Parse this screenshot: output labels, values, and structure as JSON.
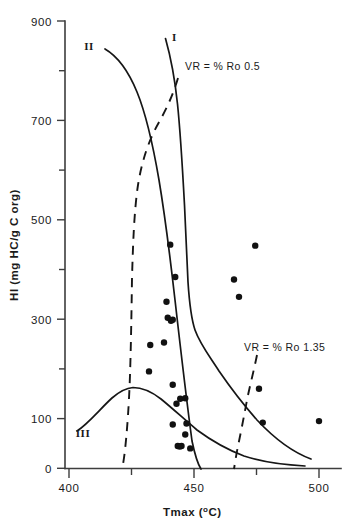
{
  "chart_data": {
    "type": "scatter",
    "title": "",
    "xlabel": "Tmax (°C)",
    "ylabel": "HI (mg HC/g C org)",
    "xlim": [
      398,
      508
    ],
    "ylim": [
      0,
      900
    ],
    "grid": false,
    "legend": "none",
    "x_ticks_major": [
      400,
      450,
      500
    ],
    "x_ticks_minor": [
      425,
      475
    ],
    "x_tick_labels": [
      "400",
      "450",
      "500"
    ],
    "y_ticks_major": [
      0,
      100,
      300,
      500,
      700,
      900
    ],
    "y_ticks_minor": [
      200,
      400,
      600,
      800
    ],
    "y_tick_labels": [
      "0",
      "100",
      "300",
      "500",
      "700",
      "900"
    ],
    "points": [
      {
        "x": 440.5,
        "y": 450
      },
      {
        "x": 442.5,
        "y": 385
      },
      {
        "x": 439.0,
        "y": 335
      },
      {
        "x": 439.5,
        "y": 303
      },
      {
        "x": 440.8,
        "y": 297
      },
      {
        "x": 441.5,
        "y": 299
      },
      {
        "x": 438.0,
        "y": 253
      },
      {
        "x": 432.5,
        "y": 248
      },
      {
        "x": 432.0,
        "y": 195
      },
      {
        "x": 441.5,
        "y": 168
      },
      {
        "x": 444.5,
        "y": 140
      },
      {
        "x": 446.5,
        "y": 141
      },
      {
        "x": 443.0,
        "y": 130
      },
      {
        "x": 441.5,
        "y": 88
      },
      {
        "x": 447.0,
        "y": 90
      },
      {
        "x": 446.5,
        "y": 68
      },
      {
        "x": 443.5,
        "y": 45
      },
      {
        "x": 444.3,
        "y": 44
      },
      {
        "x": 445.0,
        "y": 45
      },
      {
        "x": 448.5,
        "y": 40
      },
      {
        "x": 466.0,
        "y": 380
      },
      {
        "x": 468.0,
        "y": 345
      },
      {
        "x": 474.5,
        "y": 448
      },
      {
        "x": 476.0,
        "y": 160
      },
      {
        "x": 477.5,
        "y": 92
      },
      {
        "x": 500.0,
        "y": 95
      }
    ],
    "curves": [
      {
        "name": "I",
        "label": "I",
        "style": "solid",
        "kerogen_type": "Type I"
      },
      {
        "name": "II",
        "label": "II",
        "style": "solid",
        "kerogen_type": "Type II"
      },
      {
        "name": "III",
        "label": "III",
        "style": "solid",
        "kerogen_type": "Type III"
      }
    ],
    "annotations": [
      {
        "id": "vr-05",
        "text": "VR =  % Ro 0.5",
        "style": "dashed",
        "value": 0.5
      },
      {
        "id": "vr-135",
        "text": "VR = % Ro 1.35",
        "style": "dashed",
        "value": 1.35
      }
    ],
    "colors": {
      "axis": "#3d3d3d",
      "curve": "#161616",
      "point": "#111111",
      "background": "#ffffff"
    }
  },
  "axis": {
    "x_label_main": "Tmax (",
    "x_label_sup": "o",
    "x_label_tail": "C)",
    "y_label": "HI (mg HC/g C org)"
  },
  "ticks": {
    "y": {
      "t900": "900",
      "t700": "700",
      "t500": "500",
      "t300": "300",
      "t100": "100",
      "t0": "0"
    },
    "x": {
      "t400": "400",
      "t450": "450",
      "t500": "500"
    }
  },
  "curve_labels": {
    "one": "I",
    "two": "II",
    "three": "III"
  },
  "annotations": {
    "vr_low": "VR =  % Ro 0.5",
    "vr_high": "VR = % Ro 1.35"
  }
}
